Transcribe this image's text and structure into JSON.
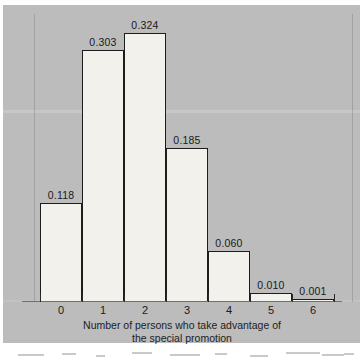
{
  "chart_data": {
    "type": "bar",
    "title": "",
    "subtitle": "",
    "xlabel_lines": [
      "Number of persons who take advantage of",
      "the special promotion"
    ],
    "xlabel": "Number of persons who take advantage of the special promotion",
    "ylabel": "",
    "categories": [
      "0",
      "1",
      "2",
      "3",
      "4",
      "5",
      "6"
    ],
    "values": [
      0.118,
      0.303,
      0.324,
      0.185,
      0.06,
      0.01,
      0.001
    ],
    "value_labels": [
      "0.118",
      "0.303",
      "0.324",
      "0.185",
      "0.060",
      "0.010",
      "0.001"
    ],
    "ylim": [
      0,
      0.324
    ],
    "grid": false,
    "legend": null,
    "axis": {
      "x_tick_labels": [
        "0",
        "1",
        "2",
        "3",
        "4",
        "5",
        "6"
      ],
      "y_axis_visible": false,
      "y_tick_labels": []
    },
    "colors": {
      "bar_fill": "#f2f1ec",
      "bar_outline": "#1d1d1d",
      "background": "#bcbcbc",
      "text": "#1a1a1a",
      "axis_line": "#6f6f6f"
    }
  }
}
